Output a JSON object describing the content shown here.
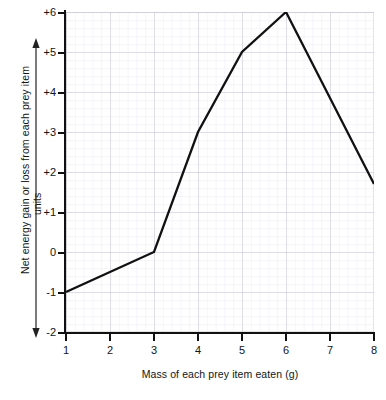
{
  "chart_data": {
    "type": "line",
    "title": "",
    "xlabel": "Mass of each prey item eaten (g)",
    "ylabel": "Net energy gain or loss from each prey item",
    "ylabel_units": "units",
    "xlim": [
      1,
      8
    ],
    "ylim": [
      -2,
      6
    ],
    "grid": true,
    "legend": "none",
    "x_ticks": [
      "1",
      "2",
      "3",
      "4",
      "5",
      "6",
      "7",
      "8"
    ],
    "y_ticks": [
      "+6",
      "+5",
      "+4",
      "+3",
      "+2",
      "+1",
      "0",
      "-1",
      "-2"
    ],
    "x": [
      1,
      3,
      4,
      5,
      6,
      8
    ],
    "values": [
      -1,
      0,
      3,
      5,
      6,
      1.7
    ],
    "series": [
      {
        "name": "Net energy gain or loss",
        "points": [
          {
            "x": 1,
            "y": -1
          },
          {
            "x": 3,
            "y": 0
          },
          {
            "x": 4,
            "y": 3
          },
          {
            "x": 5,
            "y": 5
          },
          {
            "x": 6,
            "y": 6
          },
          {
            "x": 8,
            "y": 1.7
          }
        ]
      }
    ],
    "line_color": "#111111",
    "grid_color": "#c9c9d8",
    "grid_minor_color": "#e4e4ee",
    "axis_color": "#111111"
  }
}
